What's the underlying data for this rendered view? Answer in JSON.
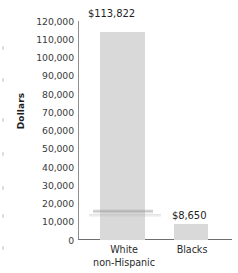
{
  "chart_data": {
    "type": "bar",
    "title": "",
    "xlabel": "",
    "ylabel": "Dollars",
    "categories": [
      "White non-Hispanic",
      "Blacks"
    ],
    "category_lines": [
      [
        "White",
        "non-Hispanic"
      ],
      [
        "Blacks"
      ]
    ],
    "values": [
      113822,
      8650
    ],
    "value_labels": [
      "$113,822",
      "$8,650"
    ],
    "ylim": [
      0,
      120000
    ],
    "ytick_values": [
      120000,
      110000,
      100000,
      90000,
      80000,
      70000,
      60000,
      50000,
      40000,
      30000,
      20000,
      10000,
      0
    ],
    "ytick_labels": [
      "120,000",
      "110,000",
      "100,000",
      "90,000",
      "80,000",
      "70,000",
      "60,000",
      "50,000",
      "40,000",
      "30,000",
      "20,000",
      "10,000",
      "0"
    ],
    "grid": false,
    "legend": false,
    "bar_color": "#d9d9d9",
    "axis_color": "#8f8f8f",
    "text_color": "#2b2b2b",
    "background": "#ffffff"
  }
}
